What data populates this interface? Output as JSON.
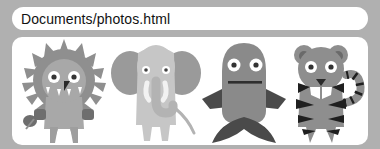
{
  "window": {
    "background_color": "#b0b0b0"
  },
  "addressbar": {
    "name": "address-bar",
    "value": "Documents/photos.html",
    "placeholder": "Enter path",
    "background_color": "#ffffff",
    "text_color": "#111111"
  },
  "content": {
    "name": "photo-gallery",
    "background_color": "#ffffff",
    "figures": [
      {
        "id": "lion",
        "label": "lion-illustration",
        "body_color": "#a8a8a8",
        "mane_color": "#8f8f8f",
        "limb_color": "#6e6e6e",
        "eye_color": "#ffffff",
        "pupil_color": "#333333",
        "nose_color": "#2a2a2a",
        "tooth_color": "#ffffff"
      },
      {
        "id": "elephant",
        "label": "elephant-illustration",
        "body_color": "#c6c6c6",
        "ear_color": "#9a9a9a",
        "trunk_color": "#b3b3b3",
        "eye_color": "#ffffff",
        "pupil_color": "#444444",
        "tusk_color": "#f2f2f2"
      },
      {
        "id": "fish",
        "label": "fish-illustration",
        "body_color": "#8a8a8a",
        "fin_color": "#4a4a4a",
        "eye_color": "#ffffff",
        "pupil_color": "#333333",
        "mouth_color": "#2e2e2e"
      },
      {
        "id": "tiger",
        "label": "tiger-illustration",
        "body_color": "#8e8e8e",
        "stripe_color": "#1f1f1f",
        "ear_inner_color": "#6a6a6a",
        "eye_color": "#ffffff",
        "pupil_color": "#333333",
        "tooth_color": "#ffffff",
        "nose_color": "#2a2a2a"
      }
    ]
  }
}
